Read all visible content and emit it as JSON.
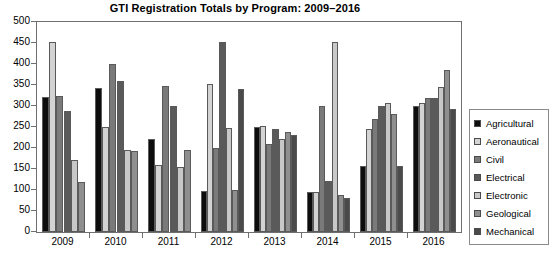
{
  "chart_data": {
    "type": "bar",
    "title": "GTI Registration Totals by Program: 2009–2016",
    "xlabel": "",
    "ylabel": "",
    "ylim": [
      0,
      500
    ],
    "ytick_step": 50,
    "yticks": [
      0,
      50,
      100,
      150,
      200,
      250,
      300,
      350,
      400,
      450,
      500
    ],
    "grid": false,
    "legend_position": "right",
    "categories": [
      "2009",
      "2010",
      "2011",
      "2012",
      "2013",
      "2014",
      "2015",
      "2016"
    ],
    "series": [
      {
        "name": "Agricultural",
        "color": "#0d0d0d",
        "values": [
          322,
          344,
          222,
          98,
          250,
          95,
          158,
          300
        ]
      },
      {
        "name": "Aeronautical",
        "color": "#d3d3d3",
        "values": [
          452,
          250,
          160,
          352,
          252,
          95,
          245,
          308
        ]
      },
      {
        "name": "Civil",
        "color": "#7a7a7a",
        "values": [
          325,
          400,
          348,
          200,
          210,
          300,
          268,
          320
        ]
      },
      {
        "name": "Electrical",
        "color": "#5a5a5a",
        "values": [
          288,
          360,
          300,
          452,
          245,
          122,
          300,
          318
        ]
      },
      {
        "name": "Electronic",
        "color": "#c8c8c8",
        "values": [
          172,
          196,
          155,
          248,
          222,
          452,
          308,
          345
        ]
      },
      {
        "name": "Geological",
        "color": "#8f8f8f",
        "values": [
          118,
          192,
          196,
          100,
          238,
          88,
          282,
          385
        ]
      },
      {
        "name": "Mechanical",
        "color": "#4a4a4a",
        "values": [
          null,
          null,
          null,
          340,
          232,
          80,
          158,
          292
        ]
      }
    ]
  },
  "legend": {
    "items": [
      {
        "label": "Agricultural",
        "color": "#0d0d0d"
      },
      {
        "label": "Aeronautical",
        "color": "#d3d3d3"
      },
      {
        "label": "Civil",
        "color": "#7a7a7a"
      },
      {
        "label": "Electrical",
        "color": "#5a5a5a"
      },
      {
        "label": "Electronic",
        "color": "#c8c8c8"
      },
      {
        "label": "Geological",
        "color": "#8f8f8f"
      },
      {
        "label": "Mechanical",
        "color": "#4a4a4a"
      }
    ]
  }
}
